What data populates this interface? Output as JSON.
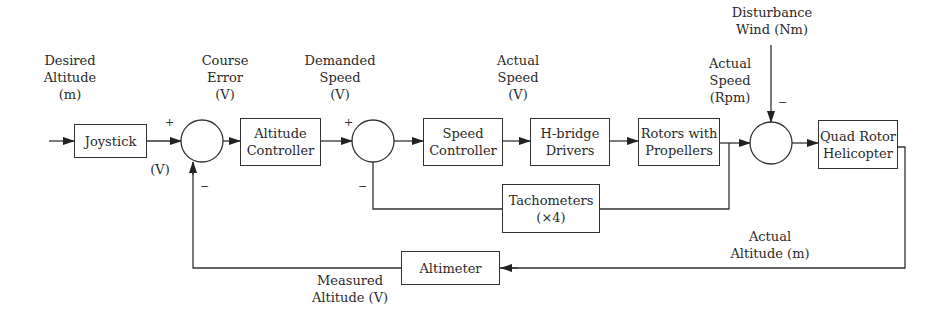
{
  "blocks": {
    "joystick": {
      "line1": "Joystick"
    },
    "altitude_controller": {
      "line1": "Altitude",
      "line2": "Controller"
    },
    "speed_controller": {
      "line1": "Speed",
      "line2": "Controller"
    },
    "hbridge": {
      "line1": "H-bridge",
      "line2": "Drivers"
    },
    "rotors": {
      "line1": "Rotors with",
      "line2": "Propellers"
    },
    "quad": {
      "line1": "Quad Rotor",
      "line2": "Helicopter"
    },
    "tachometers": {
      "line1": "Tachometers",
      "line2": "(×4)"
    },
    "altimeter": {
      "line1": "Altimeter"
    }
  },
  "signals": {
    "desired_altitude": {
      "line1": "Desired",
      "line2": "Altitude",
      "line3": "(m)"
    },
    "joystick_out": {
      "line1": "(V)"
    },
    "course_error": {
      "line1": "Course",
      "line2": "Error",
      "line3": "(V)"
    },
    "demanded_speed": {
      "line1": "Demanded",
      "line2": "Speed",
      "line3": "(V)"
    },
    "actual_speed_v": {
      "line1": "Actual",
      "line2": "Speed",
      "line3": "(V)"
    },
    "actual_speed_rpm": {
      "line1": "Actual",
      "line2": "Speed",
      "line3": "(Rpm)"
    },
    "disturbance": {
      "line1": "Disturbance",
      "line2": "Wind (Nm)"
    },
    "actual_altitude": {
      "line1": "Actual",
      "line2": "Altitude (m)"
    },
    "measured_altitude": {
      "line1": "Measured",
      "line2": "Altitude (V)"
    }
  },
  "signs": {
    "sum1_plus": "+",
    "sum1_minus": "−",
    "sum2_plus": "+",
    "sum2_minus": "−",
    "sum3_minus": "−"
  }
}
